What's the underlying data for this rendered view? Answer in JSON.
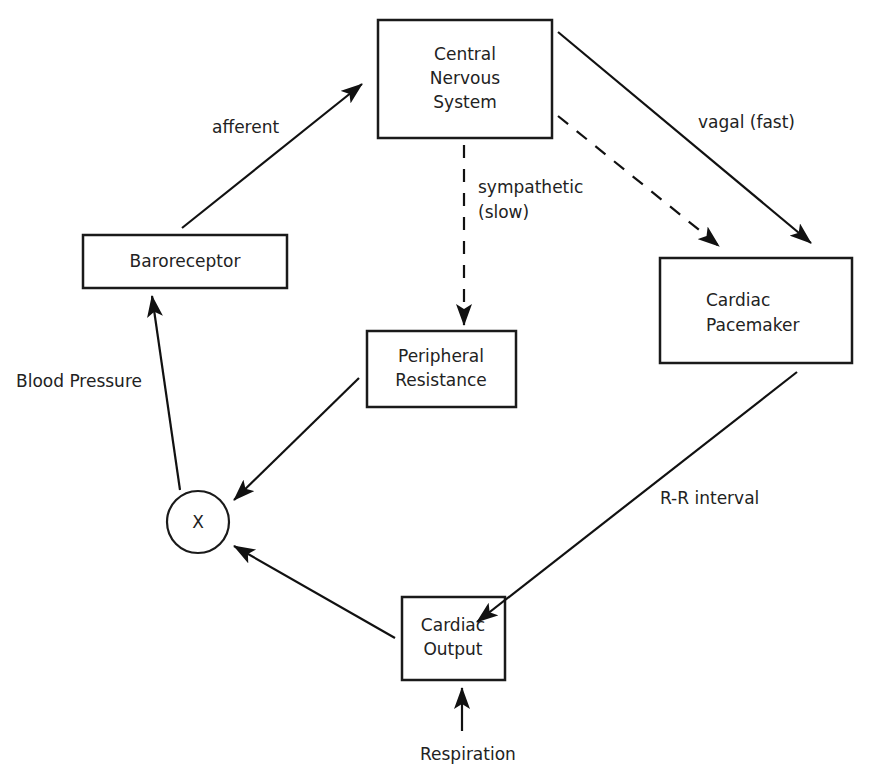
{
  "nodes": {
    "cns": {
      "lines": [
        "Central",
        "Nervous",
        "System"
      ]
    },
    "baroreceptor": {
      "lines": [
        "Baroreceptor"
      ]
    },
    "pacemaker": {
      "lines": [
        "Cardiac",
        "Pacemaker"
      ]
    },
    "peripheral": {
      "lines": [
        "Peripheral",
        "Resistance"
      ]
    },
    "multiplier": {
      "label": "X"
    },
    "output": {
      "lines": [
        "Cardiac",
        "Output"
      ]
    }
  },
  "edges": {
    "afferent": {
      "label": "afferent",
      "from": "Baroreceptor",
      "to": "Central Nervous System",
      "style": "solid"
    },
    "vagal": {
      "label": "vagal (fast)",
      "from": "Central Nervous System",
      "to": "Cardiac Pacemaker",
      "style": "solid"
    },
    "sympathetic_pacemaker": {
      "from": "Central Nervous System",
      "to": "Cardiac Pacemaker",
      "style": "dashed"
    },
    "sympathetic": {
      "lines": [
        "sympathetic",
        "(slow)"
      ],
      "from": "Central Nervous System",
      "to": "Peripheral Resistance",
      "style": "dashed"
    },
    "rr": {
      "label": "R-R interval",
      "from": "Cardiac Pacemaker",
      "to": "Cardiac Output",
      "style": "solid"
    },
    "peripheral_to_x": {
      "from": "Peripheral Resistance",
      "to": "X",
      "style": "solid"
    },
    "output_to_x": {
      "from": "Cardiac Output",
      "to": "X",
      "style": "solid"
    },
    "blood_pressure": {
      "label": "Blood Pressure",
      "from": "X",
      "to": "Baroreceptor",
      "style": "solid"
    },
    "respiration": {
      "label": "Respiration",
      "to": "Cardiac Output",
      "style": "solid"
    }
  },
  "colors": {
    "stroke": "#111111",
    "text": "#222222",
    "background": "#ffffff"
  }
}
